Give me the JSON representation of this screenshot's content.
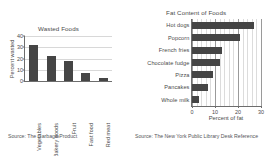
{
  "charts": [
    {
      "title": "Wasted Foods",
      "source": "Source: The Garbage Product"
    },
    {
      "title": "Fat Content of Foods",
      "source": "Source: The New York Public Library Desk Reference"
    }
  ],
  "chart_data": [
    {
      "type": "bar",
      "orientation": "vertical",
      "title": "Wasted Foods",
      "categories": [
        "Vegetables",
        "Bakery goods",
        "Fruit",
        "Fast food",
        "Red meat"
      ],
      "values": [
        32,
        22,
        18,
        7,
        3
      ],
      "xlabel": "",
      "ylabel": "Percent wasted",
      "ylim": [
        0,
        40
      ],
      "yticks": [
        0,
        10,
        20,
        30,
        40
      ],
      "grid": "horizontal",
      "legend": "none",
      "bar_color": "#454545",
      "source": "Source: The Garbage Product"
    },
    {
      "type": "bar",
      "orientation": "horizontal",
      "title": "Fat Content of Foods",
      "categories": [
        "Hot dogs",
        "Popcorn",
        "French fries",
        "Chocolate fudge",
        "Pizza",
        "Pancakes",
        "Whole milk"
      ],
      "values": [
        27,
        21,
        13,
        12,
        9,
        7,
        3
      ],
      "xlabel": "Percent of fat",
      "ylabel": "",
      "xlim": [
        0,
        30
      ],
      "xticks": [
        0,
        10,
        20,
        30
      ],
      "grid": "vertical",
      "legend": "none",
      "bar_color": "#454545",
      "source": "Source: The New York Public Library Desk Reference"
    }
  ]
}
